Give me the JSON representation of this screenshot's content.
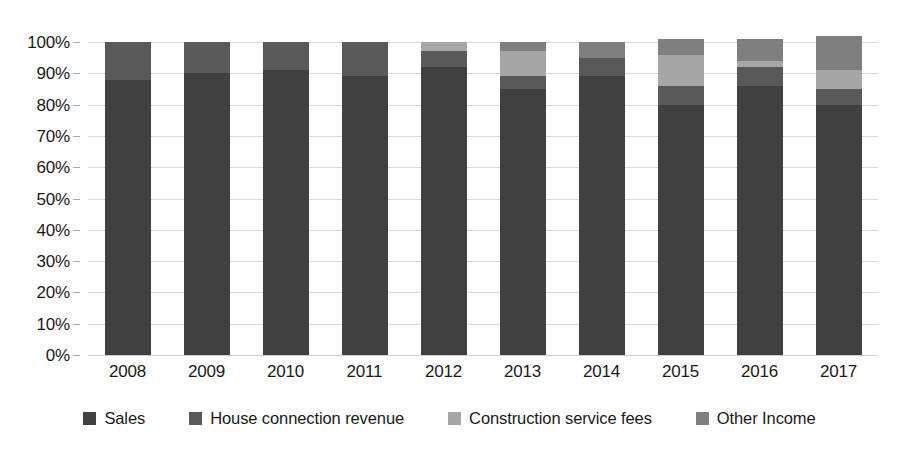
{
  "chart_data": {
    "type": "bar",
    "subtype": "stacked-percentage",
    "title": "",
    "xlabel": "",
    "ylabel": "",
    "ylim": [
      0,
      100
    ],
    "grid": true,
    "legend_position": "bottom",
    "categories": [
      "2008",
      "2009",
      "2010",
      "2011",
      "2012",
      "2013",
      "2014",
      "2015",
      "2016",
      "2017"
    ],
    "y_ticks": [
      "0%",
      "10%",
      "20%",
      "30%",
      "40%",
      "50%",
      "60%",
      "70%",
      "80%",
      "90%",
      "100%"
    ],
    "y_tick_values": [
      0,
      10,
      20,
      30,
      40,
      50,
      60,
      70,
      80,
      90,
      100
    ],
    "series": [
      {
        "name": "Sales",
        "color": "#404040",
        "values": [
          88,
          90,
          91,
          89,
          92,
          85,
          89,
          80,
          86,
          80
        ]
      },
      {
        "name": "House connection revenue",
        "color": "#595959",
        "values": [
          12,
          10,
          9,
          11,
          5,
          4,
          6,
          6,
          6,
          5
        ]
      },
      {
        "name": "Construction service fees",
        "color": "#a6a6a6",
        "values": [
          0,
          0,
          0,
          0,
          3,
          8,
          0,
          10,
          2,
          6
        ]
      },
      {
        "name": "Other Income",
        "color": "#7f7f7f",
        "values": [
          0,
          0,
          0,
          0,
          0,
          3,
          5,
          5,
          7,
          11
        ]
      }
    ]
  },
  "legend": {
    "items": [
      {
        "label": "Sales",
        "color": "#404040"
      },
      {
        "label": "House connection revenue",
        "color": "#595959"
      },
      {
        "label": "Construction service fees",
        "color": "#a6a6a6"
      },
      {
        "label": "Other Income",
        "color": "#7f7f7f"
      }
    ]
  }
}
